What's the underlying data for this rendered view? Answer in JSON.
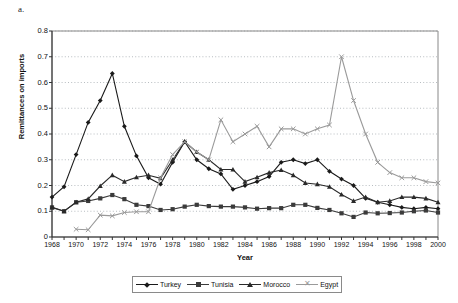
{
  "panel_label": "a.",
  "chart_data": {
    "type": "line",
    "title": "",
    "xlabel": "Year",
    "ylabel": "Remittances on imports",
    "xlim": [
      1968,
      2000
    ],
    "ylim": [
      0,
      0.8
    ],
    "ytick_labels": [
      "0.8",
      "0.7",
      "0.6",
      "0.5",
      "0.4",
      "0.3",
      "0.2",
      "0.1",
      "0"
    ],
    "ytick_values": [
      0.8,
      0.7,
      0.6,
      0.5,
      0.4,
      0.3,
      0.2,
      0.1,
      0
    ],
    "xtick_labels": [
      "1968",
      "1970",
      "1972",
      "1974",
      "1976",
      "1978",
      "1980",
      "1982",
      "1984",
      "1986",
      "1988",
      "1990",
      "1992",
      "1994",
      "1996",
      "1998",
      "2000"
    ],
    "xtick_values": [
      1968,
      1970,
      1972,
      1974,
      1976,
      1978,
      1980,
      1982,
      1984,
      1986,
      1988,
      1990,
      1992,
      1994,
      1996,
      1998,
      2000
    ],
    "grid": "horizontal-dotted",
    "legend_position": "bottom",
    "x": [
      1968,
      1969,
      1970,
      1971,
      1972,
      1973,
      1974,
      1975,
      1976,
      1977,
      1978,
      1979,
      1980,
      1981,
      1982,
      1983,
      1984,
      1985,
      1986,
      1987,
      1988,
      1989,
      1990,
      1991,
      1992,
      1993,
      1994,
      1995,
      1996,
      1997,
      1998,
      1999,
      2000
    ],
    "series": [
      {
        "name": "Turkey",
        "marker": "diamond",
        "color": "#1a1a1a",
        "values": [
          0.155,
          0.195,
          0.32,
          0.445,
          0.53,
          0.635,
          0.43,
          0.315,
          0.23,
          0.205,
          0.29,
          0.37,
          0.3,
          0.265,
          0.245,
          0.185,
          0.2,
          0.215,
          0.235,
          0.29,
          0.3,
          0.285,
          0.3,
          0.255,
          0.225,
          0.2,
          0.15,
          0.135,
          0.125,
          0.115,
          0.11,
          0.115,
          0.11
        ]
      },
      {
        "name": "Tunisia",
        "marker": "square",
        "color": "#3b3b3b",
        "values": [
          0.115,
          0.1,
          0.135,
          0.14,
          0.15,
          0.163,
          0.147,
          0.125,
          0.12,
          0.105,
          0.108,
          0.118,
          0.125,
          0.12,
          0.118,
          0.118,
          0.115,
          0.11,
          0.112,
          0.112,
          0.125,
          0.125,
          0.113,
          0.105,
          0.092,
          0.078,
          0.095,
          0.092,
          0.093,
          0.095,
          0.1,
          0.103,
          0.095
        ]
      },
      {
        "name": "Morocco",
        "marker": "triangle",
        "color": "#2a2a2a",
        "values": [
          0.115,
          0.1,
          0.135,
          0.148,
          0.198,
          0.24,
          0.215,
          0.232,
          0.24,
          0.228,
          0.3,
          0.37,
          0.33,
          0.3,
          0.262,
          0.262,
          0.215,
          0.232,
          0.25,
          0.26,
          0.24,
          0.21,
          0.205,
          0.195,
          0.165,
          0.14,
          0.155,
          0.135,
          0.14,
          0.155,
          0.155,
          0.15,
          0.135
        ]
      },
      {
        "name": "Egypt",
        "marker": "x",
        "color": "#9a9a9a",
        "values": [
          null,
          null,
          0.03,
          0.028,
          0.085,
          0.082,
          0.095,
          0.098,
          0.098,
          0.23,
          0.32,
          0.37,
          0.33,
          0.3,
          0.455,
          0.37,
          0.4,
          0.43,
          0.35,
          0.42,
          0.42,
          0.4,
          0.42,
          0.435,
          0.7,
          0.53,
          0.4,
          0.29,
          0.25,
          0.23,
          0.23,
          0.215,
          0.21
        ]
      }
    ]
  },
  "legend": {
    "items": [
      {
        "label": "Turkey",
        "marker": "diamond"
      },
      {
        "label": "Tunisia",
        "marker": "square"
      },
      {
        "label": "Morocco",
        "marker": "triangle"
      },
      {
        "label": "Egypt",
        "marker": "x"
      }
    ]
  }
}
